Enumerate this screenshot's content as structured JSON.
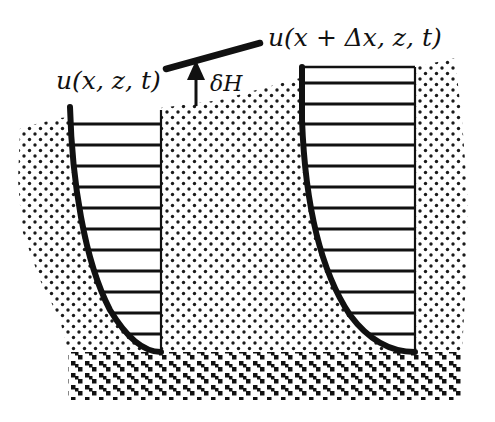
{
  "figure": {
    "type": "velocity-profile-diagram",
    "labels": {
      "left_profile": "u(x, z, t)",
      "right_profile": "u(x + Δx, z, t)",
      "height_change": "δH"
    },
    "colors": {
      "ink": "#111111",
      "background": "#ffffff",
      "stipple": "#1a1a1a"
    },
    "left_profile": {
      "top_y": 107,
      "bottom_y": 352,
      "right_x": 161,
      "bar_count": 11
    },
    "right_profile": {
      "top_y": 67,
      "bottom_y": 352,
      "right_x": 415,
      "bar_count": 14
    }
  }
}
